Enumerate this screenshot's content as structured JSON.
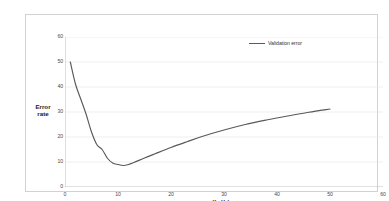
{
  "chart_data": {
    "type": "line",
    "title": "",
    "xlabel": "K - Value",
    "ylabel_line1": "Error",
    "ylabel_line2": "rate",
    "xlim": [
      0,
      60
    ],
    "ylim": [
      0,
      60
    ],
    "xticks": [
      0,
      10,
      20,
      30,
      40,
      50,
      60
    ],
    "yticks": [
      0,
      10,
      20,
      30,
      40,
      50,
      60
    ],
    "grid": "horizontal",
    "legend_position": "top-right",
    "series": [
      {
        "name": "Validation error",
        "color": "#595959",
        "x": [
          1,
          2,
          3,
          4,
          5,
          6,
          7,
          8,
          9,
          10,
          11,
          12,
          13,
          15,
          17,
          20,
          23,
          26,
          30,
          34,
          38,
          42,
          46,
          50
        ],
        "values": [
          50,
          41,
          35,
          29,
          22,
          17,
          15,
          11.5,
          9.6,
          9.0,
          8.6,
          9.0,
          9.8,
          11.6,
          13.3,
          15.8,
          18.1,
          20.3,
          22.8,
          25.0,
          26.8,
          28.4,
          29.9,
          31.2
        ]
      }
    ]
  },
  "legend": {
    "entries": [
      {
        "label": "Validation error",
        "color": "#595959"
      }
    ]
  },
  "axes": {
    "y_tick_labels": [
      "60",
      "50",
      "40",
      "30",
      "20",
      "10",
      "0"
    ],
    "x_tick_labels": [
      "0",
      "10",
      "20",
      "30",
      "40",
      "50",
      "60"
    ],
    "y_title_line1": "Error",
    "y_title_line2": "rate",
    "x_title": "K - Value"
  }
}
